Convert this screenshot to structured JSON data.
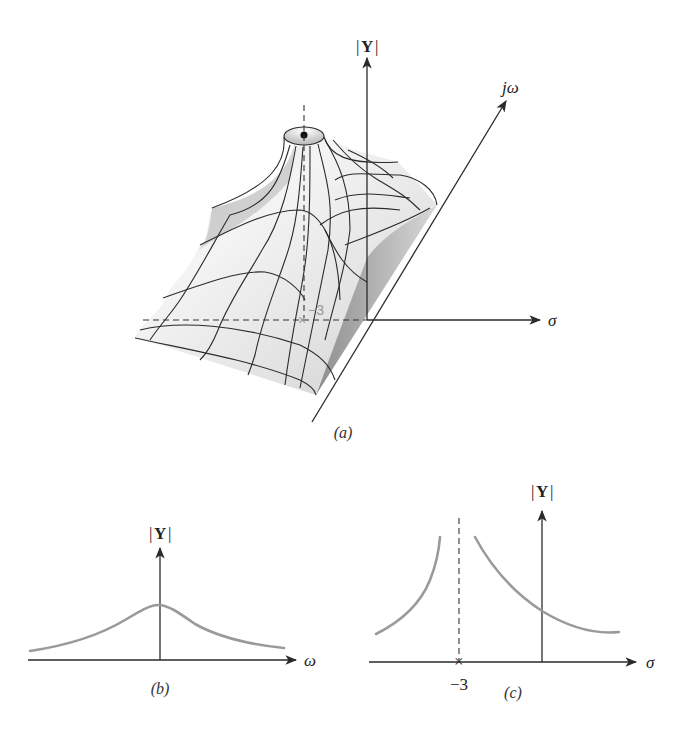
{
  "figure": {
    "panel_a": {
      "caption": "(a)",
      "y_axis_label": "|Y|",
      "y_axis_label_inner": "Y",
      "jw_axis_label": "jω",
      "sigma_axis_label": "σ",
      "pole_label": "−3",
      "description": "3D surface plot of |Y| over the s-plane with a pole at σ = −3"
    },
    "panel_b": {
      "caption": "(b)",
      "y_axis_label": "|Y|",
      "y_axis_label_inner": "Y",
      "x_axis_label": "ω",
      "description": "|Y| versus ω along jω axis: bell-shaped curve peaking at ω = 0"
    },
    "panel_c": {
      "caption": "(c)",
      "y_axis_label": "|Y|",
      "y_axis_label_inner": "Y",
      "x_axis_label": "σ",
      "pole_label": "−3",
      "description": "|Y| versus σ along real axis: rises to infinity on both sides of the pole at σ = −3"
    },
    "colors": {
      "axes": "#2a2a2a",
      "curve": "#9a9a9a",
      "surface_light": "#f2f2f2",
      "surface_dark": "#a8a8a8"
    }
  }
}
